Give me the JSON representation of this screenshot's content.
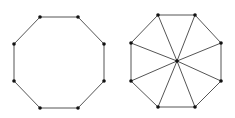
{
  "diagram": {
    "type": "graph",
    "colors": {
      "edge": "#555555",
      "vertex": "#111111",
      "background": "#ffffff"
    },
    "graphs": [
      {
        "name": "octagon-cycle",
        "vertices": [
          [
            40,
            17
          ],
          [
            78,
            17
          ],
          [
            104,
            44
          ],
          [
            104,
            81
          ],
          [
            78,
            108
          ],
          [
            40,
            108
          ],
          [
            14,
            81
          ],
          [
            14,
            44
          ]
        ],
        "edges": "cycle",
        "hub": null
      },
      {
        "name": "octagon-wheel",
        "vertices": [
          [
            158,
            15
          ],
          [
            195,
            15
          ],
          [
            221,
            43
          ],
          [
            221,
            81
          ],
          [
            195,
            107
          ],
          [
            158,
            107
          ],
          [
            131,
            81
          ],
          [
            131,
            43
          ]
        ],
        "edges": "cycle+spokes",
        "hub": [
          177,
          61
        ]
      }
    ]
  }
}
